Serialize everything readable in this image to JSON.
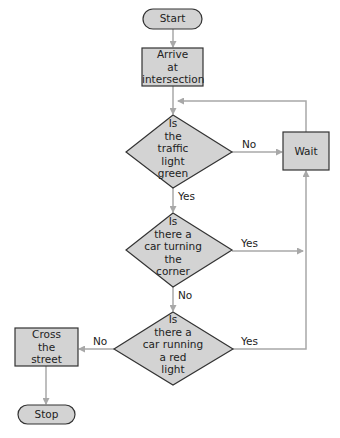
{
  "diagram": {
    "type": "flowchart",
    "colors": {
      "node_fill": "#d3d3d3",
      "node_border": "#333333",
      "arrow": "#a8a8a8",
      "background": "#ffffff"
    },
    "nodes": {
      "start": {
        "shape": "terminal",
        "label": "Start"
      },
      "arrive": {
        "shape": "process",
        "lines": [
          "Arrive",
          "at",
          "intersection"
        ]
      },
      "q_green": {
        "shape": "decision",
        "lines": [
          "Is",
          "the",
          "traffic",
          "light",
          "green"
        ]
      },
      "wait": {
        "shape": "process",
        "label": "Wait"
      },
      "q_turning": {
        "shape": "decision",
        "lines": [
          "Is",
          "there a",
          "car turning",
          "the",
          "corner"
        ]
      },
      "q_running": {
        "shape": "decision",
        "lines": [
          "Is",
          "there a",
          "car running",
          "a red",
          "light"
        ]
      },
      "cross": {
        "shape": "process",
        "lines": [
          "Cross",
          "the",
          "street"
        ]
      },
      "stop": {
        "shape": "terminal",
        "label": "Stop"
      }
    },
    "edges": {
      "green_no": "No",
      "green_yes": "Yes",
      "turning_yes": "Yes",
      "turning_no": "No",
      "running_no": "No",
      "running_yes": "Yes"
    }
  }
}
